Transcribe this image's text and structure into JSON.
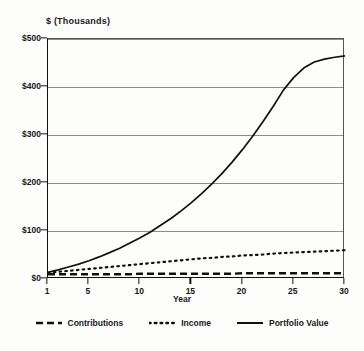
{
  "chart_data": {
    "type": "line",
    "title": "$ (Thousands)",
    "xlabel": "Year",
    "ylabel": "",
    "xlim": [
      1,
      30
    ],
    "ylim": [
      0,
      500
    ],
    "grid": true,
    "legend_position": "bottom",
    "x_ticks": [
      1,
      5,
      10,
      15,
      20,
      25,
      30
    ],
    "x_tick_labels": [
      "1",
      "5",
      "10",
      "15",
      "20",
      "25",
      "30"
    ],
    "y_ticks": [
      0,
      100,
      200,
      300,
      400,
      500
    ],
    "y_tick_labels": [
      "$0",
      "$100",
      "$200",
      "$300",
      "$400",
      "$500"
    ],
    "x": [
      1,
      2,
      3,
      4,
      5,
      6,
      7,
      8,
      9,
      10,
      11,
      12,
      13,
      14,
      15,
      16,
      17,
      18,
      19,
      20,
      21,
      22,
      23,
      24,
      25,
      26,
      27,
      28,
      29,
      30
    ],
    "series": [
      {
        "name": "Contributions",
        "style": "dashed",
        "color": "#111111",
        "values": [
          10,
          10,
          10,
          10,
          10,
          10,
          10,
          10,
          10,
          11,
          11,
          11,
          11,
          11,
          11,
          11,
          11,
          11,
          11,
          12,
          12,
          12,
          12,
          12,
          12,
          12,
          12,
          12,
          12,
          12
        ]
      },
      {
        "name": "Income",
        "style": "dotted",
        "color": "#111111",
        "values": [
          13,
          15,
          17,
          19,
          21,
          23,
          25,
          27,
          29,
          31,
          33,
          35,
          37,
          39,
          41,
          43,
          44,
          46,
          47,
          49,
          50,
          51,
          53,
          54,
          55,
          56,
          57,
          58,
          59,
          60
        ]
      },
      {
        "name": "Portfolio Value",
        "style": "solid",
        "color": "#111111",
        "values": [
          14,
          19,
          25,
          31,
          38,
          46,
          55,
          64,
          75,
          86,
          98,
          112,
          126,
          142,
          159,
          178,
          198,
          220,
          244,
          270,
          298,
          328,
          360,
          394,
          420,
          440,
          452,
          458,
          462,
          465
        ]
      }
    ]
  },
  "legend": {
    "items": [
      {
        "label": "Contributions",
        "style": "dashed"
      },
      {
        "label": "Income",
        "style": "dotted"
      },
      {
        "label": "Portfolio Value",
        "style": "solid"
      }
    ]
  }
}
